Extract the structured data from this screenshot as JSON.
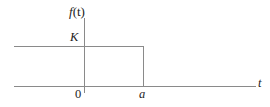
{
  "figure": {
    "kind": "step-function-plot",
    "background_color": "#ffffff",
    "line_color": "#8a8a8a",
    "text_color": "#1d1d1d"
  },
  "labels": {
    "y_axis": "f(t)",
    "y_axis_function_name": "f",
    "y_axis_argument": "(t)",
    "amplitude": "K",
    "origin": "0",
    "breakpoint": "a",
    "x_axis": "t"
  },
  "chart_data": {
    "type": "line",
    "title": "",
    "xlabel": "t",
    "ylabel": "f(t)",
    "subtitle": "",
    "grid": false,
    "legend": null,
    "annotations": [
      {
        "text": "K",
        "x": 0,
        "y": 1,
        "role": "y-tick-label"
      },
      {
        "text": "0",
        "x": 0,
        "y": 0,
        "role": "origin-label"
      },
      {
        "text": "a",
        "x": 1,
        "y": 0,
        "role": "x-tick-label"
      },
      {
        "text": "f(t)",
        "x": 0,
        "y": 1.45,
        "role": "y-axis-label"
      },
      {
        "text": "t",
        "x": 2.35,
        "y": 0,
        "role": "x-axis-label"
      }
    ],
    "xlim": [
      -0.55,
      2.4
    ],
    "ylim": [
      -0.12,
      1.45
    ],
    "xticks": [
      0,
      1
    ],
    "xticklabels": [
      "0",
      "a"
    ],
    "yticks": [
      1
    ],
    "yticklabels": [
      "K"
    ],
    "series": [
      {
        "name": "f(t)",
        "description": "Rectangular pulse of height K ending at t = a; value K for t < a, 0 for t > a",
        "x": [
          -0.55,
          1,
          1,
          2.33
        ],
        "values": [
          1,
          1,
          0,
          0
        ]
      }
    ]
  }
}
